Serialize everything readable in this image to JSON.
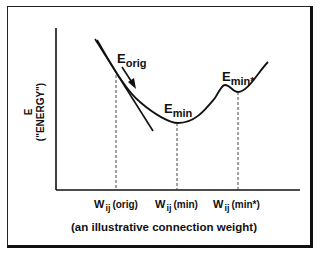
{
  "diagram": {
    "y_axis_label_line1": "E",
    "y_axis_label_line2": "(\"ENERGY\")",
    "x_axis_caption": "(an illustrative connection weight)",
    "points": [
      {
        "label_main": "E",
        "label_sub": "orig",
        "id": "e-orig"
      },
      {
        "label_main": "E",
        "label_sub": "min",
        "id": "e-min"
      },
      {
        "label_main": "E",
        "label_sub": "min*",
        "id": "e-min-star"
      }
    ],
    "x_ticks": [
      {
        "main": "W",
        "sub": "ij",
        "suffix": "(orig)"
      },
      {
        "main": "W",
        "sub": "ij",
        "suffix": "(min)"
      },
      {
        "main": "W",
        "sub": "ij",
        "suffix": "(min*)"
      }
    ],
    "colors": {
      "ink": "#111111",
      "background": "#ffffff"
    }
  }
}
